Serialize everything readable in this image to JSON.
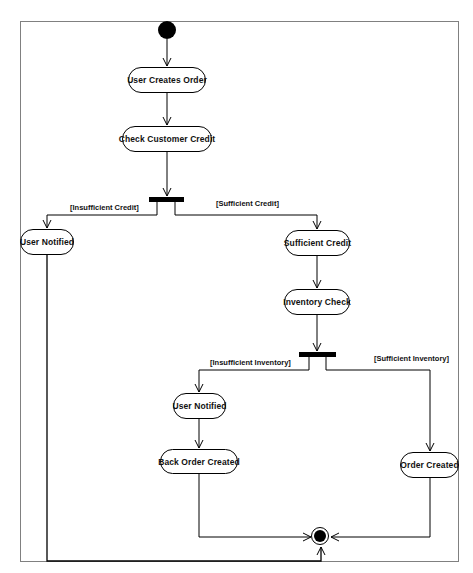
{
  "diagram": {
    "type": "UML activity diagram",
    "start_node": "initial-node",
    "end_node": "final-node",
    "activities": {
      "user_creates_order": "User Creates Order",
      "check_customer_credit": "Check Customer Credit",
      "user_notified_credit": "User Notified",
      "sufficient_credit": "Sufficient Credit",
      "inventory_check": "Inventory Check",
      "user_notified_inventory": "User Notified",
      "back_order_created": "Back Order Created",
      "order_created": "Order Created"
    },
    "guards": {
      "insufficient_credit": "[Insufficient Credit]",
      "sufficient_credit": "[Sufficient Credit]",
      "insufficient_inventory": "[Insufficient Inventory]",
      "sufficient_inventory": "[Sufficient Inventory]"
    },
    "flows": [
      {
        "from": "Start",
        "to": "User Creates Order"
      },
      {
        "from": "User Creates Order",
        "to": "Check Customer Credit"
      },
      {
        "from": "Check Customer Credit",
        "to": "Credit Fork"
      },
      {
        "from": "Credit Fork",
        "to": "User Notified",
        "guard": "[Insufficient Credit]"
      },
      {
        "from": "Credit Fork",
        "to": "Sufficient Credit",
        "guard": "[Sufficient Credit]"
      },
      {
        "from": "Sufficient Credit",
        "to": "Inventory Check"
      },
      {
        "from": "Inventory Check",
        "to": "Inventory Fork"
      },
      {
        "from": "Inventory Fork",
        "to": "User Notified",
        "guard": "[Insufficient Inventory]"
      },
      {
        "from": "Inventory Fork",
        "to": "Order Created",
        "guard": "[Sufficient Inventory]"
      },
      {
        "from": "User Notified",
        "to": "Back Order Created"
      },
      {
        "from": "Back Order Created",
        "to": "End"
      },
      {
        "from": "Order Created",
        "to": "End"
      },
      {
        "from": "User Notified (credit)",
        "to": "End"
      }
    ],
    "colors": {
      "line": "#000000",
      "frame": "#808080",
      "background": "#ffffff"
    }
  }
}
